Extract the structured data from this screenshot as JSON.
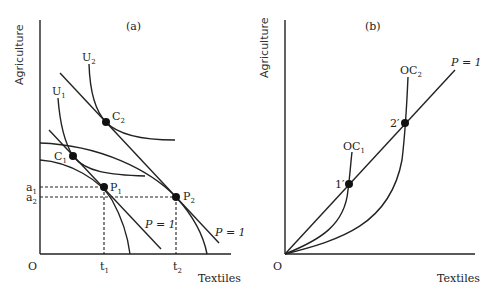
{
  "panel_a": {
    "title": "(a)",
    "y_axis_label": "Agriculture",
    "x_axis_label": "Textiles",
    "origin_label": "O",
    "indifference_curves": [
      {
        "label_main": "U",
        "label_sub": "1"
      },
      {
        "label_main": "U",
        "label_sub": "2"
      }
    ],
    "consumption_points": [
      {
        "label_main": "C",
        "label_sub": "1"
      },
      {
        "label_main": "C",
        "label_sub": "2"
      }
    ],
    "production_points": [
      {
        "label_main": "P",
        "label_sub": "1"
      },
      {
        "label_main": "P",
        "label_sub": "2"
      }
    ],
    "y_ticks": [
      {
        "label_main": "a",
        "label_sub": "1"
      },
      {
        "label_main": "a",
        "label_sub": "2"
      }
    ],
    "x_ticks": [
      {
        "label_main": "t",
        "label_sub": "1"
      },
      {
        "label_main": "t",
        "label_sub": "2"
      }
    ],
    "price_line_labels": [
      "P = 1",
      "P = 1"
    ]
  },
  "panel_b": {
    "title": "(b)",
    "y_axis_label": "Agriculture",
    "x_axis_label": "Textiles",
    "origin_label": "O",
    "offer_curves": [
      {
        "label_main": "OC",
        "label_sub": "1"
      },
      {
        "label_main": "OC",
        "label_sub": "2"
      }
    ],
    "points": [
      "1′",
      "2′"
    ],
    "price_line_label": "P = 1"
  }
}
